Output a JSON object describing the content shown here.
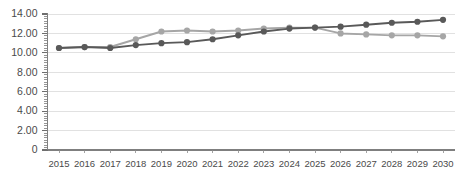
{
  "chart_data": {
    "type": "line",
    "title": "",
    "subtitle": "",
    "xlabel": "",
    "ylabel": "",
    "categories": [
      "2015",
      "2016",
      "2017",
      "2018",
      "2019",
      "2020",
      "2021",
      "2022",
      "2023",
      "2024",
      "2025",
      "2026",
      "2027",
      "2028",
      "2029",
      "2030"
    ],
    "ylim": [
      0,
      14
    ],
    "ytick_labels": [
      "14.00",
      "12.00",
      "10.00",
      "8.00",
      "6.00",
      "4.00",
      "2.00",
      "0"
    ],
    "ytick_values": [
      14,
      12,
      10,
      8,
      6,
      4,
      2,
      0
    ],
    "grid": true,
    "grid_axis": "y",
    "legend": false,
    "legend_position": "none",
    "minor_ticks_y": true,
    "series": [
      {
        "name": "Series 1",
        "color": "#a6a6a6",
        "marker": "circle",
        "values": [
          10.5,
          10.6,
          10.6,
          11.4,
          12.2,
          12.3,
          12.2,
          12.3,
          12.5,
          12.6,
          12.6,
          12.0,
          11.9,
          11.8,
          11.8,
          11.7
        ]
      },
      {
        "name": "Series 2",
        "color": "#595959",
        "marker": "circle",
        "values": [
          10.5,
          10.6,
          10.5,
          10.8,
          11.0,
          11.1,
          11.4,
          11.8,
          12.2,
          12.5,
          12.6,
          12.7,
          12.9,
          13.1,
          13.2,
          13.4
        ]
      }
    ]
  },
  "axes": {
    "y_axis_color": "#7f7f7f",
    "x_axis_color": "#7f7f7f",
    "gridline_color": "#d9d9d9"
  }
}
